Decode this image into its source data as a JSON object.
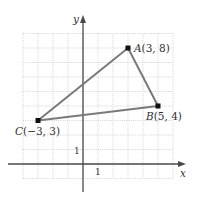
{
  "diagram": {
    "type": "coordinate-plane-triangle",
    "axes": {
      "x_label": "x",
      "y_label": "y",
      "x_range": [
        -4,
        6
      ],
      "y_range": [
        -1,
        9
      ],
      "x_tick_label": "1",
      "y_tick_label": "1",
      "grid": true
    },
    "points": [
      {
        "name": "A",
        "x": 3,
        "y": 8,
        "label": "A(3, 8)",
        "label_pos": "right"
      },
      {
        "name": "B",
        "x": 5,
        "y": 4,
        "label": "B(5, 4)",
        "label_pos": "below-left"
      },
      {
        "name": "C",
        "x": -3,
        "y": 3,
        "label": "C(−3, 3)",
        "label_pos": "below-left"
      }
    ],
    "edges": [
      [
        "A",
        "B"
      ],
      [
        "B",
        "C"
      ],
      [
        "C",
        "A"
      ]
    ],
    "colors": {
      "edge": "#7a7a7a",
      "point": "#111111",
      "axis": "#4a4a4a",
      "grid": "#c8c8c8"
    }
  }
}
